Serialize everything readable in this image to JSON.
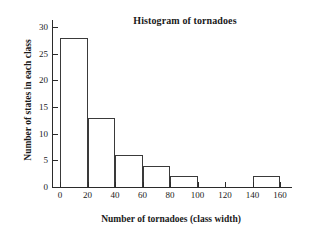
{
  "chart_data": {
    "type": "bar",
    "title": "Histogram of tornadoes",
    "xlabel": "Number of tornadoes (class width)",
    "ylabel": "Number of states in each class",
    "xlim": [
      0,
      160
    ],
    "ylim": [
      0,
      30
    ],
    "grid": false,
    "legend": null,
    "xticks": [
      0,
      20,
      40,
      60,
      80,
      100,
      120,
      140,
      160
    ],
    "yticks": [
      0,
      5,
      10,
      15,
      20,
      25,
      30
    ],
    "bin_width": 20,
    "bins": [
      {
        "range": "0-20",
        "start": 0,
        "end": 20,
        "count": 28
      },
      {
        "range": "20-40",
        "start": 20,
        "end": 40,
        "count": 13
      },
      {
        "range": "40-60",
        "start": 40,
        "end": 60,
        "count": 6
      },
      {
        "range": "60-80",
        "start": 60,
        "end": 80,
        "count": 4
      },
      {
        "range": "80-100",
        "start": 80,
        "end": 100,
        "count": 2
      },
      {
        "range": "100-120",
        "start": 100,
        "end": 120,
        "count": 0
      },
      {
        "range": "120-140",
        "start": 120,
        "end": 140,
        "count": 0
      },
      {
        "range": "140-160",
        "start": 140,
        "end": 160,
        "count": 2
      }
    ],
    "categories": [
      "0-20",
      "20-40",
      "40-60",
      "60-80",
      "80-100",
      "100-120",
      "120-140",
      "140-160"
    ],
    "values": [
      28,
      13,
      6,
      4,
      2,
      0,
      0,
      2
    ],
    "colors": {
      "bar_fill": "#ffffff",
      "bar_stroke": "#3a3a3a",
      "axis": "#2b2b2b",
      "text": "#1a1a1a",
      "background": "#ffffff"
    }
  }
}
